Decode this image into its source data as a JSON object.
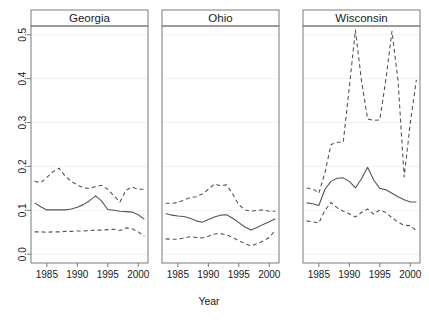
{
  "chart_data": {
    "type": "line",
    "title": "",
    "xlabel": "Year",
    "ylabel": "",
    "xlim": [
      1982.4,
      2001.6
    ],
    "ylim": [
      -0.02,
      0.52
    ],
    "grid": true,
    "legend": "none",
    "x_ticks": [
      1985,
      1990,
      1995,
      2000
    ],
    "x_tick_labels": [
      "1985",
      "1990",
      "1995",
      "2000"
    ],
    "y_ticks": [
      0.0,
      0.1,
      0.2,
      0.3,
      0.4,
      0.5
    ],
    "y_tick_labels": [
      "0.0",
      "0.1",
      "0.2",
      "0.3",
      "0.4",
      "0.5"
    ],
    "x": [
      1983,
      1984,
      1985,
      1986,
      1987,
      1988,
      1989,
      1990,
      1991,
      1992,
      1993,
      1994,
      1995,
      1996,
      1997,
      1998,
      1999,
      2000,
      2001
    ],
    "panels": [
      {
        "label": "Georgia",
        "series": [
          {
            "name": "upper",
            "style": "dashed",
            "values": [
              0.166,
              0.163,
              0.175,
              0.188,
              0.196,
              0.178,
              0.166,
              0.158,
              0.151,
              0.15,
              0.154,
              0.157,
              0.148,
              0.133,
              0.119,
              0.146,
              0.153,
              0.148,
              0.148
            ]
          },
          {
            "name": "estimate",
            "style": "solid",
            "values": [
              0.117,
              0.108,
              0.101,
              0.101,
              0.101,
              0.101,
              0.103,
              0.107,
              0.113,
              0.122,
              0.133,
              0.121,
              0.102,
              0.1,
              0.098,
              0.097,
              0.096,
              0.09,
              0.08
            ]
          },
          {
            "name": "lower",
            "style": "dashed",
            "values": [
              0.051,
              0.051,
              0.05,
              0.051,
              0.051,
              0.052,
              0.052,
              0.053,
              0.053,
              0.054,
              0.055,
              0.055,
              0.056,
              0.057,
              0.054,
              0.06,
              0.058,
              0.051,
              0.041
            ]
          }
        ]
      },
      {
        "label": "Ohio",
        "series": [
          {
            "name": "upper",
            "style": "dashed",
            "values": [
              0.116,
              0.116,
              0.118,
              0.123,
              0.129,
              0.131,
              0.137,
              0.148,
              0.16,
              0.156,
              0.158,
              0.137,
              0.113,
              0.101,
              0.098,
              0.1,
              0.101,
              0.098,
              0.098
            ]
          },
          {
            "name": "estimate",
            "style": "solid",
            "values": [
              0.093,
              0.089,
              0.087,
              0.086,
              0.082,
              0.076,
              0.073,
              0.079,
              0.085,
              0.089,
              0.09,
              0.082,
              0.072,
              0.062,
              0.055,
              0.061,
              0.068,
              0.074,
              0.081
            ]
          },
          {
            "name": "lower",
            "style": "dashed",
            "values": [
              0.035,
              0.034,
              0.034,
              0.037,
              0.04,
              0.038,
              0.037,
              0.041,
              0.046,
              0.047,
              0.044,
              0.038,
              0.031,
              0.024,
              0.019,
              0.024,
              0.03,
              0.038,
              0.055
            ]
          }
        ]
      },
      {
        "label": "Wisconsin",
        "series": [
          {
            "name": "upper",
            "style": "dashed",
            "values": [
              0.151,
              0.149,
              0.139,
              0.186,
              0.25,
              0.255,
              0.255,
              0.38,
              0.511,
              0.395,
              0.308,
              0.305,
              0.306,
              0.398,
              0.508,
              0.395,
              0.176,
              0.298,
              0.397
            ]
          },
          {
            "name": "estimate",
            "style": "solid",
            "values": [
              0.117,
              0.115,
              0.111,
              0.148,
              0.166,
              0.173,
              0.174,
              0.166,
              0.151,
              0.172,
              0.198,
              0.169,
              0.15,
              0.147,
              0.139,
              0.131,
              0.124,
              0.119,
              0.119
            ]
          },
          {
            "name": "lower",
            "style": "dashed",
            "values": [
              0.076,
              0.074,
              0.071,
              0.1,
              0.118,
              0.106,
              0.098,
              0.092,
              0.085,
              0.095,
              0.103,
              0.091,
              0.101,
              0.095,
              0.083,
              0.073,
              0.066,
              0.065,
              0.054
            ]
          }
        ]
      }
    ]
  },
  "axis": {
    "x_title": "Year"
  },
  "colors": {
    "line": "#555555",
    "border": "#7a7a7a",
    "grid": "#f2f2f2",
    "background": "#ffffff"
  }
}
